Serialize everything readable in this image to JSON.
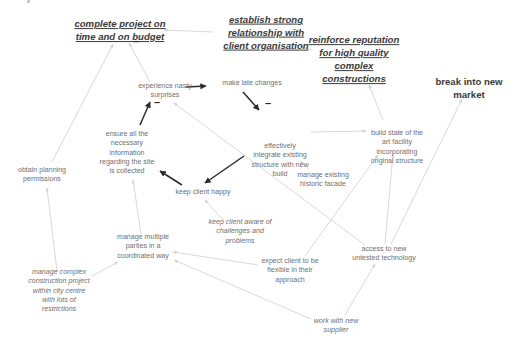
{
  "diagram": {
    "type": "cognitive-map",
    "colors": {
      "background": "#ffffff",
      "goal_text": "#3a3a3a",
      "concept_text": "#6f6f6f",
      "strong_edge": "#2b2b2b",
      "faint_edge": "#d9d9d9"
    },
    "nodes": [
      {
        "id": "complete_project",
        "style": "goal",
        "x": 120,
        "y": 31,
        "lines": [
          "complete project on",
          "time and on budget"
        ]
      },
      {
        "id": "client_relationship",
        "style": "goal",
        "x": 266,
        "y": 33,
        "lines": [
          "establish strong",
          "relationship with",
          "client organisation"
        ]
      },
      {
        "id": "reinforce_reputation",
        "style": "goal",
        "x": 354,
        "y": 60,
        "lines": [
          "reinforce reputation",
          "for high quality",
          "complex",
          "constructions"
        ]
      },
      {
        "id": "break_market",
        "style": "bold",
        "x": 469,
        "y": 89,
        "lines": [
          "break into new",
          "market"
        ]
      },
      {
        "id": "nasty_surprises",
        "style": "plain",
        "x": 165,
        "y": 91,
        "lines": [
          "experience nasty",
          "surprises"
        ]
      },
      {
        "id": "late_changes",
        "style": "plain",
        "x": 252,
        "y": 84,
        "lines": [
          "make late changes"
        ]
      },
      {
        "id": "integrate_structure",
        "style": "plain",
        "x": 280,
        "y": 161,
        "lines": [
          "effectively",
          "integrate existing",
          "structure with new",
          "build"
        ]
      },
      {
        "id": "build_facility",
        "style": "plain",
        "x": 397,
        "y": 148,
        "lines": [
          "build state of the",
          "art facility",
          "incorporating",
          "original structure"
        ]
      },
      {
        "id": "ensure_info",
        "style": "plain",
        "x": 127,
        "y": 153,
        "lines": [
          "ensure all the",
          "necessary",
          "information",
          "regarding the site",
          "is collected"
        ]
      },
      {
        "id": "obtain_permissions",
        "style": "plain",
        "x": 42,
        "y": 175,
        "lines": [
          "obtain planning",
          "permissions"
        ]
      },
      {
        "id": "keep_client_happy",
        "style": "plain",
        "x": 203,
        "y": 193,
        "lines": [
          "keep client happy"
        ]
      },
      {
        "id": "historic_facade",
        "style": "plain",
        "x": 323,
        "y": 180,
        "lines": [
          "manage existing",
          "historic facade"
        ]
      },
      {
        "id": "keep_client_aware",
        "style": "italic",
        "x": 240,
        "y": 232,
        "lines": [
          "keep client aware of",
          "challenges and",
          "problems"
        ]
      },
      {
        "id": "manage_parties",
        "style": "plain",
        "x": 143,
        "y": 247,
        "lines": [
          "manage multiple",
          "parties in a",
          "coordinated way"
        ]
      },
      {
        "id": "access_technology",
        "style": "plain",
        "x": 384,
        "y": 254,
        "lines": [
          "access to new",
          "untested technology"
        ]
      },
      {
        "id": "expect_flexible",
        "style": "plain",
        "x": 290,
        "y": 271,
        "lines": [
          "expect client to be",
          "flexible in their",
          "approach"
        ]
      },
      {
        "id": "complex_project",
        "style": "italic",
        "x": 59,
        "y": 291,
        "lines": [
          "manage complex",
          "construction project",
          "within city centre",
          "with lots of",
          "restrictions"
        ]
      },
      {
        "id": "new_supplier",
        "style": "italic",
        "x": 336,
        "y": 326,
        "lines": [
          "work with new",
          "supplier"
        ]
      }
    ],
    "edges": [
      {
        "from": "client_relationship",
        "to": "complete_project",
        "strength": "faint",
        "x1": 213,
        "y1": 32,
        "x2": 164,
        "y2": 30
      },
      {
        "from": "reinforce_reputation",
        "to": "client_relationship",
        "strength": "faint",
        "x1": 312,
        "y1": 50,
        "x2": 293,
        "y2": 44
      },
      {
        "from": "nasty_surprises",
        "to": "complete_project",
        "strength": "faint",
        "x1": 150,
        "y1": 82,
        "x2": 129,
        "y2": 43,
        "sign": "-",
        "sign_x": 133,
        "sign_y": 42
      },
      {
        "from": "obtain_permissions",
        "to": "complete_project",
        "strength": "faint",
        "x1": 52,
        "y1": 162,
        "x2": 113,
        "y2": 44
      },
      {
        "from": "nasty_surprises",
        "to": "late_changes",
        "strength": "strong",
        "x1": 186,
        "y1": 87,
        "x2": 206,
        "y2": 86
      },
      {
        "from": "late_changes",
        "to": "integrate_structure",
        "strength": "strong",
        "x1": 243,
        "y1": 92,
        "x2": 259,
        "y2": 110,
        "sign": "-",
        "sign_x": 265,
        "sign_y": 104
      },
      {
        "from": "ensure_info",
        "to": "nasty_surprises",
        "strength": "strong",
        "x1": 140,
        "y1": 125,
        "x2": 150,
        "y2": 102,
        "sign": "-",
        "sign_x": 154,
        "sign_y": 103
      },
      {
        "from": "integrate_structure",
        "to": "keep_client_happy",
        "strength": "strong",
        "x1": 244,
        "y1": 156,
        "x2": 205,
        "y2": 183
      },
      {
        "from": "keep_client_happy",
        "to": "ensure_info",
        "strength": "strong",
        "x1": 182,
        "y1": 185,
        "x2": 160,
        "y2": 171
      },
      {
        "from": "integrate_structure",
        "to": "build_facility",
        "strength": "faint",
        "x1": 311,
        "y1": 132,
        "x2": 366,
        "y2": 131
      },
      {
        "from": "build_facility",
        "to": "reinforce_reputation",
        "strength": "faint",
        "x1": 383,
        "y1": 120,
        "x2": 369,
        "y2": 85
      },
      {
        "from": "historic_facade",
        "to": "integrate_structure",
        "strength": "faint",
        "x1": 309,
        "y1": 169,
        "x2": 300,
        "y2": 161
      },
      {
        "from": "access_technology",
        "to": "nasty_surprises",
        "strength": "faint",
        "x1": 365,
        "y1": 245,
        "x2": 174,
        "y2": 103
      },
      {
        "from": "access_technology",
        "to": "build_facility",
        "strength": "faint",
        "x1": 385,
        "y1": 244,
        "x2": 393,
        "y2": 154
      },
      {
        "from": "access_technology",
        "to": "break_market",
        "strength": "faint",
        "x1": 391,
        "y1": 244,
        "x2": 462,
        "y2": 99
      },
      {
        "from": "expect_flexible",
        "to": "build_facility",
        "strength": "faint",
        "x1": 305,
        "y1": 256,
        "x2": 378,
        "y2": 155
      },
      {
        "from": "keep_client_aware",
        "to": "keep_client_happy",
        "strength": "faint",
        "x1": 223,
        "y1": 220,
        "x2": 205,
        "y2": 200
      },
      {
        "from": "manage_parties",
        "to": "ensure_info",
        "strength": "faint",
        "x1": 141,
        "y1": 234,
        "x2": 133,
        "y2": 180
      },
      {
        "from": "expect_flexible",
        "to": "manage_parties",
        "strength": "faint",
        "x1": 258,
        "y1": 265,
        "x2": 173,
        "y2": 252
      },
      {
        "from": "new_supplier",
        "to": "manage_parties",
        "strength": "faint",
        "x1": 311,
        "y1": 319,
        "x2": 174,
        "y2": 260
      },
      {
        "from": "new_supplier",
        "to": "access_technology",
        "strength": "faint",
        "x1": 345,
        "y1": 315,
        "x2": 375,
        "y2": 264
      },
      {
        "from": "complex_project",
        "to": "manage_parties",
        "strength": "faint",
        "x1": 92,
        "y1": 276,
        "x2": 118,
        "y2": 262
      },
      {
        "from": "complex_project",
        "to": "obtain_permissions",
        "strength": "faint",
        "x1": 57,
        "y1": 271,
        "x2": 47,
        "y2": 188
      }
    ]
  }
}
